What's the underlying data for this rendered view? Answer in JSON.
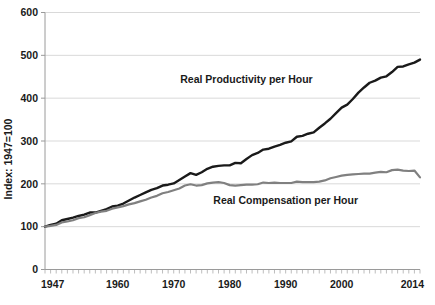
{
  "chart_data": {
    "type": "line",
    "title": "",
    "xlabel": "",
    "ylabel": "Index: 1947=100",
    "ylim": [
      0,
      600
    ],
    "xlim": [
      1947,
      2014
    ],
    "ytick_values": [
      0,
      100,
      200,
      300,
      400,
      500,
      600
    ],
    "ytick_labels": [
      "0",
      "100",
      "200",
      "300",
      "400",
      "500",
      "600"
    ],
    "xtick_values": [
      1947,
      1960,
      1970,
      1980,
      1990,
      2000,
      2014
    ],
    "xtick_labels": [
      "1947",
      "1960",
      "1970",
      "1980",
      "1990",
      "2000",
      "2014"
    ],
    "grid": "horizontal",
    "legend_position": "inline-annotations",
    "minor_ticks": "every year on x-axis",
    "series": [
      {
        "name": "Real Productivity per Hour",
        "color": "#1a1a1a",
        "label_x": 1983,
        "label_y": 435,
        "x": [
          1947,
          1948,
          1949,
          1950,
          1951,
          1952,
          1953,
          1954,
          1955,
          1956,
          1957,
          1958,
          1959,
          1960,
          1961,
          1962,
          1963,
          1964,
          1965,
          1966,
          1967,
          1968,
          1969,
          1970,
          1971,
          1972,
          1973,
          1974,
          1975,
          1976,
          1977,
          1978,
          1979,
          1980,
          1981,
          1982,
          1983,
          1984,
          1985,
          1986,
          1987,
          1988,
          1989,
          1990,
          1991,
          1992,
          1993,
          1994,
          1995,
          1996,
          1997,
          1998,
          1999,
          2000,
          2001,
          2002,
          2003,
          2004,
          2005,
          2006,
          2007,
          2008,
          2009,
          2010,
          2011,
          2012,
          2013,
          2014
        ],
        "y": [
          100,
          104,
          107,
          115,
          118,
          121,
          125,
          128,
          133,
          133,
          137,
          141,
          147,
          149,
          154,
          161,
          168,
          174,
          180,
          186,
          190,
          196,
          198,
          201,
          209,
          217,
          225,
          221,
          227,
          235,
          240,
          242,
          243,
          243,
          249,
          248,
          258,
          267,
          272,
          280,
          282,
          287,
          291,
          296,
          299,
          310,
          312,
          317,
          320,
          331,
          341,
          352,
          365,
          378,
          385,
          398,
          413,
          425,
          436,
          441,
          448,
          451,
          461,
          473,
          474,
          479,
          483,
          490
        ]
      },
      {
        "name": "Real Compensation per Hour",
        "color": "#808080",
        "label_x": 1990,
        "label_y": 152,
        "x": [
          1947,
          1948,
          1949,
          1950,
          1951,
          1952,
          1953,
          1954,
          1955,
          1956,
          1957,
          1958,
          1959,
          1960,
          1961,
          1962,
          1963,
          1964,
          1965,
          1966,
          1967,
          1968,
          1969,
          1970,
          1971,
          1972,
          1973,
          1974,
          1975,
          1976,
          1977,
          1978,
          1979,
          1980,
          1981,
          1982,
          1983,
          1984,
          1985,
          1986,
          1987,
          1988,
          1989,
          1990,
          1991,
          1992,
          1993,
          1994,
          1995,
          1996,
          1997,
          1998,
          1999,
          2000,
          2001,
          2002,
          2003,
          2004,
          2005,
          2006,
          2007,
          2008,
          2009,
          2010,
          2011,
          2012,
          2013,
          2014
        ],
        "y": [
          100,
          102,
          104,
          110,
          112,
          115,
          120,
          122,
          127,
          132,
          135,
          137,
          142,
          145,
          148,
          152,
          155,
          159,
          163,
          168,
          172,
          178,
          181,
          185,
          189,
          196,
          199,
          196,
          197,
          201,
          203,
          204,
          202,
          197,
          196,
          197,
          198,
          198,
          199,
          203,
          202,
          203,
          202,
          202,
          202,
          205,
          204,
          204,
          204,
          205,
          208,
          213,
          216,
          219,
          221,
          222,
          223,
          224,
          224,
          226,
          228,
          227,
          232,
          233,
          231,
          230,
          231,
          215
        ]
      }
    ]
  },
  "annotations": {
    "productivity_label": "Real Productivity per Hour",
    "compensation_label": "Real Compensation per Hour"
  }
}
